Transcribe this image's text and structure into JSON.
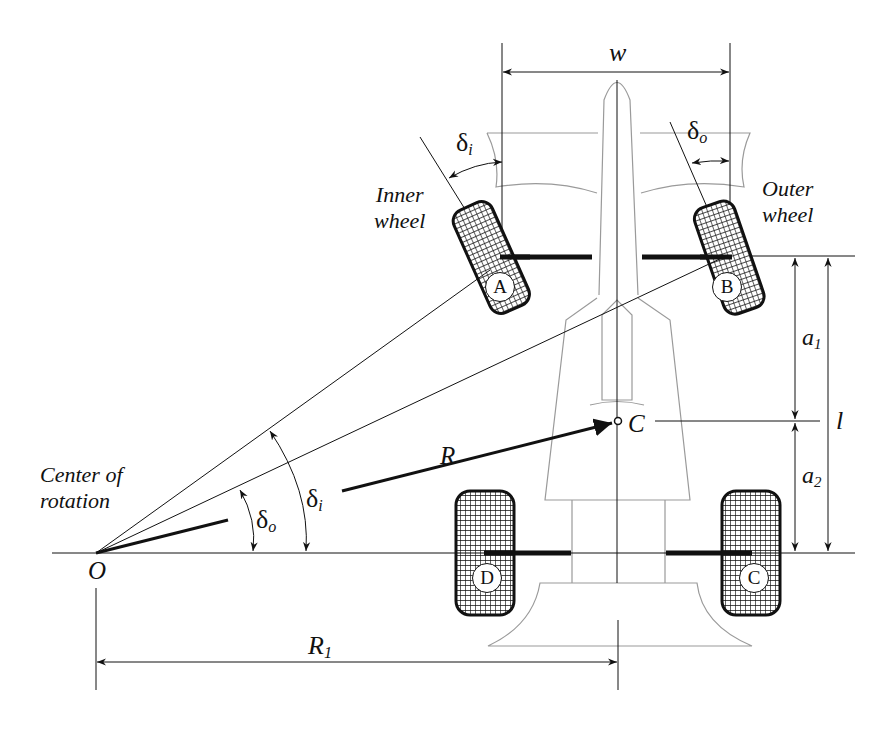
{
  "labels": {
    "width": "w",
    "delta_i_top": "δ",
    "delta_i_top_sub": "i",
    "delta_o_top": "δ",
    "delta_o_top_sub": "o",
    "inner_wheel_line1": "Inner",
    "inner_wheel_line2": "wheel",
    "outer_wheel_line1": "Outer",
    "outer_wheel_line2": "wheel",
    "a1": "a",
    "a1_sub": "1",
    "a2": "a",
    "a2_sub": "2",
    "wheelbase": "l",
    "mass_center": "C",
    "radius": "R",
    "center_rotation_line1": "Center of",
    "center_rotation_line2": "rotation",
    "origin": "O",
    "delta_i_bottom": "δ",
    "delta_i_bottom_sub": "i",
    "delta_o_bottom": "δ",
    "delta_o_bottom_sub": "o",
    "r1": "R",
    "r1_sub": "1"
  },
  "wheels": [
    {
      "id": "A",
      "position": "front-left (inner)"
    },
    {
      "id": "B",
      "position": "front-right (outer)"
    },
    {
      "id": "C",
      "position": "rear-right"
    },
    {
      "id": "D",
      "position": "rear-left"
    }
  ],
  "colors": {
    "line": "#111111",
    "body_outline": "#9a9a9a",
    "background": "#ffffff"
  }
}
